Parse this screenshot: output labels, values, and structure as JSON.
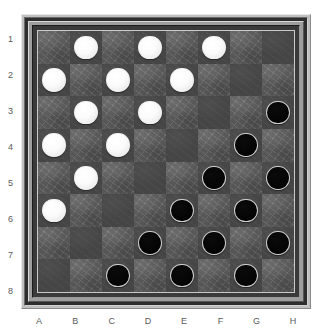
{
  "board": {
    "title": "Checkers Board",
    "size": 8,
    "file_labels": [
      "A",
      "B",
      "C",
      "D",
      "E",
      "F",
      "G",
      "H"
    ],
    "rank_labels": [
      "1",
      "2",
      "3",
      "4",
      "5",
      "6",
      "7",
      "8"
    ],
    "colors": {
      "light_square": "#5b5b5b",
      "dark_square": "#454545",
      "white_piece": "#ffffff",
      "black_piece": "#000000",
      "frame_outer": "#bfbfbf",
      "frame_inner": "#2e2e2e",
      "label_text": "#595959",
      "page_background": "#ffffff"
    },
    "piece_counts": {
      "white": 12,
      "black": 12
    },
    "squares": [
      [
        {
          "square": "A1",
          "shade": "light",
          "piece": null
        },
        {
          "square": "B1",
          "shade": "dark",
          "piece": "white"
        },
        {
          "square": "C1",
          "shade": "light",
          "piece": null
        },
        {
          "square": "D1",
          "shade": "dark",
          "piece": "white"
        },
        {
          "square": "E1",
          "shade": "light",
          "piece": null
        },
        {
          "square": "F1",
          "shade": "dark",
          "piece": "white"
        },
        {
          "square": "G1",
          "shade": "light",
          "piece": null
        },
        {
          "square": "H1",
          "shade": "dark",
          "piece": null
        }
      ],
      [
        {
          "square": "A2",
          "shade": "dark",
          "piece": "white"
        },
        {
          "square": "B2",
          "shade": "light",
          "piece": null
        },
        {
          "square": "C2",
          "shade": "dark",
          "piece": "white"
        },
        {
          "square": "D2",
          "shade": "light",
          "piece": null
        },
        {
          "square": "E2",
          "shade": "dark",
          "piece": "white"
        },
        {
          "square": "F2",
          "shade": "light",
          "piece": null
        },
        {
          "square": "G2",
          "shade": "dark",
          "piece": null
        },
        {
          "square": "H2",
          "shade": "light",
          "piece": null
        }
      ],
      [
        {
          "square": "A3",
          "shade": "light",
          "piece": null
        },
        {
          "square": "B3",
          "shade": "dark",
          "piece": "white"
        },
        {
          "square": "C3",
          "shade": "light",
          "piece": null
        },
        {
          "square": "D3",
          "shade": "dark",
          "piece": "white"
        },
        {
          "square": "E3",
          "shade": "light",
          "piece": null
        },
        {
          "square": "F3",
          "shade": "dark",
          "piece": null
        },
        {
          "square": "G3",
          "shade": "light",
          "piece": null
        },
        {
          "square": "H3",
          "shade": "dark",
          "piece": "black"
        }
      ],
      [
        {
          "square": "A4",
          "shade": "dark",
          "piece": "white"
        },
        {
          "square": "B4",
          "shade": "light",
          "piece": null
        },
        {
          "square": "C4",
          "shade": "dark",
          "piece": "white"
        },
        {
          "square": "D4",
          "shade": "light",
          "piece": null
        },
        {
          "square": "E4",
          "shade": "dark",
          "piece": null
        },
        {
          "square": "F4",
          "shade": "light",
          "piece": null
        },
        {
          "square": "G4",
          "shade": "dark",
          "piece": "black"
        },
        {
          "square": "H4",
          "shade": "light",
          "piece": null
        }
      ],
      [
        {
          "square": "A5",
          "shade": "light",
          "piece": null
        },
        {
          "square": "B5",
          "shade": "dark",
          "piece": "white"
        },
        {
          "square": "C5",
          "shade": "light",
          "piece": null
        },
        {
          "square": "D5",
          "shade": "dark",
          "piece": null
        },
        {
          "square": "E5",
          "shade": "light",
          "piece": null
        },
        {
          "square": "F5",
          "shade": "dark",
          "piece": "black"
        },
        {
          "square": "G5",
          "shade": "light",
          "piece": null
        },
        {
          "square": "H5",
          "shade": "dark",
          "piece": "black"
        }
      ],
      [
        {
          "square": "A6",
          "shade": "dark",
          "piece": "white"
        },
        {
          "square": "B6",
          "shade": "light",
          "piece": null
        },
        {
          "square": "C6",
          "shade": "dark",
          "piece": null
        },
        {
          "square": "D6",
          "shade": "light",
          "piece": null
        },
        {
          "square": "E6",
          "shade": "dark",
          "piece": "black"
        },
        {
          "square": "F6",
          "shade": "light",
          "piece": null
        },
        {
          "square": "G6",
          "shade": "dark",
          "piece": "black"
        },
        {
          "square": "H6",
          "shade": "light",
          "piece": null
        }
      ],
      [
        {
          "square": "A7",
          "shade": "light",
          "piece": null
        },
        {
          "square": "B7",
          "shade": "dark",
          "piece": null
        },
        {
          "square": "C7",
          "shade": "light",
          "piece": null
        },
        {
          "square": "D7",
          "shade": "dark",
          "piece": "black"
        },
        {
          "square": "E7",
          "shade": "light",
          "piece": null
        },
        {
          "square": "F7",
          "shade": "dark",
          "piece": "black"
        },
        {
          "square": "G7",
          "shade": "light",
          "piece": null
        },
        {
          "square": "H7",
          "shade": "dark",
          "piece": "black"
        }
      ],
      [
        {
          "square": "A8",
          "shade": "dark",
          "piece": null
        },
        {
          "square": "B8",
          "shade": "light",
          "piece": null
        },
        {
          "square": "C8",
          "shade": "dark",
          "piece": "black"
        },
        {
          "square": "D8",
          "shade": "light",
          "piece": null
        },
        {
          "square": "E8",
          "shade": "dark",
          "piece": "black"
        },
        {
          "square": "F8",
          "shade": "light",
          "piece": null
        },
        {
          "square": "G8",
          "shade": "dark",
          "piece": "black"
        },
        {
          "square": "H8",
          "shade": "light",
          "piece": null
        }
      ]
    ]
  }
}
